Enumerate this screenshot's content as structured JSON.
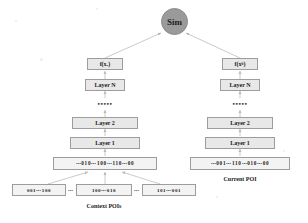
{
  "diagram": {
    "colors": {
      "sim_fill": "#9a9a9a",
      "box_fill": "#e8e8e8",
      "vector_fill": "#f3f3f3",
      "border": "#9d9d9d",
      "line": "#b9b9b9",
      "text": "#1a1a1a",
      "background": "#ffffff"
    },
    "similarity_node": {
      "label": "Sim"
    },
    "left_tower": {
      "name": "context-tower",
      "output": "f(xₐ)",
      "layer_n": "Layer N",
      "ellipsis": "•••••",
      "layer_2": "Layer 2",
      "layer_1": "Layer 1",
      "input_vector": "⋯010⋯100⋯110⋯00"
    },
    "right_tower": {
      "name": "current-tower",
      "output": "f(xᵇ)",
      "layer_n": "Layer N",
      "ellipsis": "•••••",
      "layer_2": "Layer 2",
      "layer_1": "Layer 1",
      "input_vector": "⋯001⋯110⋯010⋯00"
    },
    "context_pois": {
      "caption": "Context POIs",
      "items": [
        "001⋯100",
        "100⋯010",
        "101⋯001"
      ],
      "separator": "⋯"
    },
    "current_poi": {
      "caption": "Current POI"
    }
  }
}
